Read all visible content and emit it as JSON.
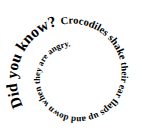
{
  "spiral": {
    "segments": [
      {
        "text": "Did you know? ",
        "size": 15.5
      },
      {
        "text": "Crocodiles shake ",
        "size": 10.5
      },
      {
        "text": "their ear flaps ",
        "size": 9.5
      },
      {
        "text": "up and down when ",
        "size": 9
      },
      {
        "text": "they are angry.",
        "size": 8.5
      }
    ],
    "full_text": "Did you know? Crocodiles shake their ear flaps up and down when they are angry.",
    "color": "#000000",
    "center": [
      75,
      76
    ],
    "start_radius": 60,
    "radius_decrease_per_turn": 23,
    "start_angle_deg": 150,
    "turns": 2.8
  }
}
